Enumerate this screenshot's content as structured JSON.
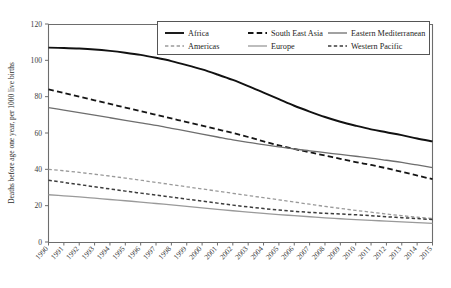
{
  "chart_data": {
    "type": "line",
    "title": "",
    "xlabel": "",
    "ylabel": "Deaths before age one year, per 1000 live births",
    "xlim": [
      1990,
      2015
    ],
    "ylim": [
      0,
      120
    ],
    "yticks": [
      0,
      20,
      40,
      60,
      80,
      100,
      120
    ],
    "grid": false,
    "legend_position": "top-center",
    "legend_columns": 3,
    "x": [
      1990,
      1991,
      1992,
      1993,
      1994,
      1995,
      1996,
      1997,
      1998,
      1999,
      2000,
      2001,
      2002,
      2003,
      2004,
      2005,
      2006,
      2007,
      2008,
      2009,
      2010,
      2011,
      2012,
      2013,
      2014,
      2015
    ],
    "categories": [
      "1990",
      "1991",
      "1992",
      "1993",
      "1994",
      "1995",
      "1996",
      "1997",
      "1998",
      "1999",
      "2000",
      "2001",
      "2002",
      "2003",
      "2004",
      "2005",
      "2006",
      "2007",
      "2008",
      "2009",
      "2010",
      "2011",
      "2012",
      "2013",
      "2014",
      "2015"
    ],
    "series": [
      {
        "name": "Africa",
        "style": "solid",
        "color": "#111111",
        "width": 1.9,
        "values": [
          107,
          106.8,
          106.5,
          106,
          105.2,
          104.2,
          103,
          101.4,
          99.6,
          97.4,
          95,
          92.2,
          89.2,
          85.8,
          82.2,
          78.6,
          75,
          71.8,
          68.8,
          66.2,
          64,
          62,
          60.4,
          58.8,
          57,
          55.4
        ]
      },
      {
        "name": "South East Asia",
        "style": "dashed",
        "color": "#151515",
        "width": 1.8,
        "values": [
          84,
          82,
          80,
          78,
          76,
          74,
          72,
          70,
          68,
          66,
          64,
          62,
          60,
          57.8,
          55.4,
          53.2,
          51.2,
          49.4,
          47.6,
          45.8,
          44,
          42.4,
          40.6,
          38.6,
          36.6,
          34.6
        ]
      },
      {
        "name": "Eastern Mediterranean",
        "style": "solid",
        "color": "#6e6e6e",
        "width": 1.3,
        "values": [
          74,
          72.6,
          71.2,
          69.8,
          68.4,
          67,
          65.6,
          64.2,
          62.6,
          61,
          59.4,
          57.8,
          56.2,
          54.8,
          53.6,
          52.4,
          51.2,
          50.2,
          49.2,
          48.2,
          47.2,
          46.2,
          45,
          43.8,
          42.4,
          41
        ]
      },
      {
        "name": "Americas",
        "style": "dashed",
        "color": "#9a9a9a",
        "width": 1.3,
        "values": [
          40,
          39.2,
          38.3,
          37.3,
          36.3,
          35.2,
          34,
          32.8,
          31.6,
          30.4,
          29.2,
          28,
          26.8,
          25.6,
          24.4,
          23.2,
          22,
          20.8,
          19.6,
          18.5,
          17.4,
          16.4,
          15.4,
          14.5,
          13.7,
          13
        ]
      },
      {
        "name": "Europe",
        "style": "solid",
        "color": "#9a9a9a",
        "width": 1.3,
        "values": [
          26,
          25.4,
          24.8,
          24.1,
          23.4,
          22.7,
          22,
          21.2,
          20.4,
          19.6,
          18.8,
          18,
          17.2,
          16.5,
          15.8,
          15.1,
          14.5,
          13.9,
          13.3,
          12.8,
          12.3,
          11.9,
          11.5,
          11.1,
          10.7,
          10.3
        ]
      },
      {
        "name": "Western Pacific",
        "style": "dashed",
        "color": "#3c3c3c",
        "width": 1.5,
        "values": [
          34,
          32.8,
          31.6,
          30.4,
          29.2,
          28,
          26.9,
          25.8,
          24.7,
          23.6,
          22.5,
          21.4,
          20.3,
          19.3,
          18.4,
          17.6,
          16.9,
          16.3,
          15.8,
          15.4,
          15,
          14.5,
          13.9,
          13.4,
          12.9,
          12.4
        ]
      }
    ]
  },
  "legend": {
    "entries": [
      {
        "label": "Africa"
      },
      {
        "label": "South East Asia"
      },
      {
        "label": "Eastern Mediterranean"
      },
      {
        "label": "Americas"
      },
      {
        "label": "Europe"
      },
      {
        "label": "Western Pacific"
      }
    ]
  },
  "axis": {
    "y_title": "Deaths before age one year, per 1000 live births",
    "y_ticks": [
      "0",
      "20",
      "40",
      "60",
      "80",
      "100",
      "120"
    ],
    "x_ticks": [
      "1990",
      "1991",
      "1992",
      "1993",
      "1994",
      "1995",
      "1996",
      "1997",
      "1998",
      "1999",
      "2000",
      "2001",
      "2002",
      "2003",
      "2004",
      "2005",
      "2006",
      "2007",
      "2008",
      "2009",
      "2010",
      "2011",
      "2012",
      "2013",
      "2014",
      "2015"
    ]
  },
  "colors": {
    "africa": "#111111",
    "south_east_asia": "#151515",
    "eastern_mediterranean": "#6e6e6e",
    "americas": "#9a9a9a",
    "europe": "#9a9a9a",
    "western_pacific": "#3c3c3c",
    "axis": "#6d6d6d",
    "background": "#ffffff"
  }
}
